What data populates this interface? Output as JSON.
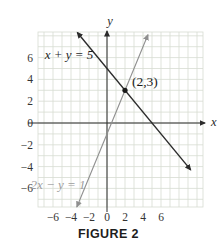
{
  "figure": {
    "caption": "FIGURE 2",
    "axes": {
      "x_label": "x",
      "y_label": "y"
    },
    "x_tick_labels": [
      "−6",
      "−4",
      "−2",
      "0",
      "2",
      "4",
      "6"
    ],
    "x_tick_values": [
      -6,
      -4,
      -2,
      0,
      2,
      4,
      6
    ],
    "y_tick_labels": [
      "6",
      "4",
      "2",
      "0",
      "−2",
      "−4",
      "−6"
    ],
    "y_tick_values": [
      6,
      4,
      2,
      0,
      -2,
      -4,
      -6
    ],
    "grid_color": "#d7dcd2",
    "axis_color": "#2b2b2b",
    "lines": [
      {
        "name": "line-x-plus-y-equals-5",
        "label": "x + y = 5",
        "color": "#2b2b2b",
        "label_color": "#1f1f1f",
        "endpoints": [
          [
            -3.3,
            8.3
          ],
          [
            9.3,
            -4.3
          ]
        ]
      },
      {
        "name": "line-2x-minus-y-equals-1",
        "label": "2x − y = 1",
        "color": "#8f8f8f",
        "label_color": "#9d9d9d",
        "endpoints": [
          [
            -3.35,
            -7.7
          ],
          [
            4.55,
            8.1
          ]
        ]
      }
    ],
    "point": {
      "x": 2,
      "y": 3,
      "label": "(2,3)"
    }
  },
  "chart_data": {
    "type": "line",
    "title": "FIGURE 2",
    "xlabel": "x",
    "ylabel": "y",
    "xlim": [
      -7.5,
      10.5
    ],
    "ylim": [
      -7.7,
      8.4
    ],
    "xticks": [
      -6,
      -4,
      -2,
      0,
      2,
      4,
      6
    ],
    "yticks": [
      6,
      4,
      2,
      0,
      -2,
      -4,
      -6
    ],
    "grid": true,
    "legend_position": "none",
    "series": [
      {
        "name": "x + y = 5",
        "equation": "x + y = 5",
        "slope": -1,
        "y_intercept": 5,
        "color": "#2b2b2b",
        "points": [
          [
            -3,
            8
          ],
          [
            0,
            5
          ],
          [
            2,
            3
          ],
          [
            5,
            0
          ],
          [
            9,
            -4
          ]
        ]
      },
      {
        "name": "2x − y = 1",
        "equation": "2x − y = 1",
        "slope": 2,
        "y_intercept": -1,
        "color": "#8f8f8f",
        "points": [
          [
            -3,
            -7
          ],
          [
            0,
            -1
          ],
          [
            0.5,
            0
          ],
          [
            2,
            3
          ],
          [
            4.5,
            8
          ]
        ]
      }
    ],
    "annotations": [
      {
        "type": "point",
        "x": 2,
        "y": 3,
        "text": "(2,3)",
        "meaning": "intersection of the two lines"
      }
    ]
  }
}
